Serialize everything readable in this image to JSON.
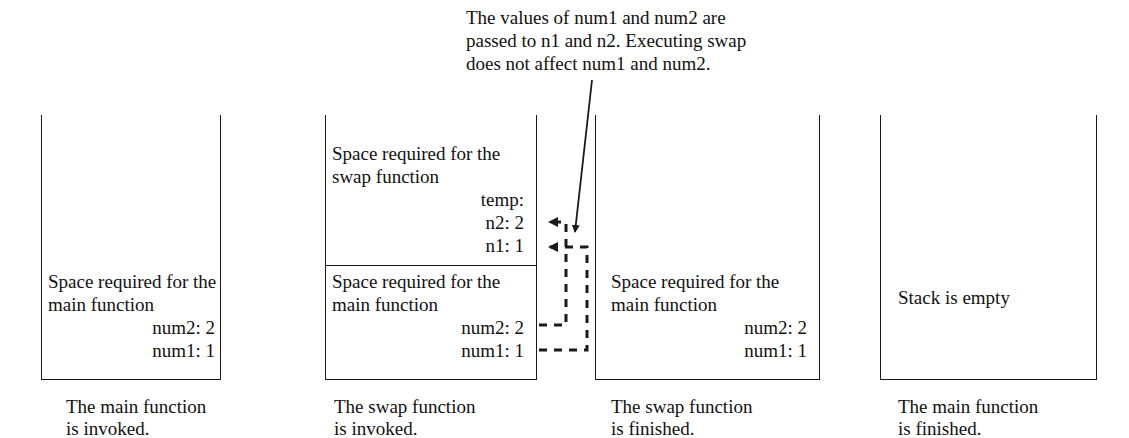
{
  "diagram": {
    "annotation": {
      "text": "The values of num1 and num2 are\npassed to n1 and n2. Executing swap\ndoes not affect num1 and num2."
    },
    "stroke_color": "#1a1a1a",
    "text_color": "#111111",
    "frames": [
      {
        "id": "stage-1",
        "caption": "The main function\nis invoked.",
        "sections": [
          {
            "id": "main-frame-1",
            "heading": "Space required for the\nmain function",
            "variables": [
              "num2: 2",
              "num1: 1"
            ]
          }
        ]
      },
      {
        "id": "stage-2",
        "caption": "The swap function\nis invoked.",
        "sections": [
          {
            "id": "swap-frame-2",
            "heading": "Space required for the\nswap function",
            "variables": [
              "temp:",
              "n2: 2",
              "n1: 1"
            ]
          },
          {
            "id": "main-frame-2",
            "heading": "Space required for the\nmain function",
            "variables": [
              "num2: 2",
              "num1: 1"
            ]
          }
        ]
      },
      {
        "id": "stage-3",
        "caption": "The swap function\nis finished.",
        "sections": [
          {
            "id": "main-frame-3",
            "heading": "Space required for the\nmain function",
            "variables": [
              "num2: 2",
              "num1: 1"
            ]
          }
        ]
      },
      {
        "id": "stage-4",
        "caption": "The main function\nis finished.",
        "sections": [
          {
            "id": "empty-frame-4",
            "heading": "Stack is empty",
            "variables": []
          }
        ]
      }
    ]
  }
}
